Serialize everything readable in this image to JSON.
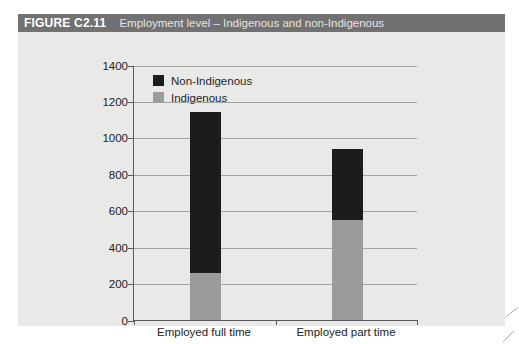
{
  "figure": {
    "label": "FIGURE C2.11",
    "title": "Employment level – Indigenous and non-Indigenous"
  },
  "colors": {
    "header_bg": "#717171",
    "figure_bg": "#e9e9e8",
    "non_indigenous": "#1c1c1c",
    "indigenous": "#9b9b9a",
    "gridline": "#a3a3a2",
    "axis": "#5a5a5a",
    "text": "#222222"
  },
  "chart_data": {
    "type": "bar",
    "stacked": true,
    "title": "Employment level – Indigenous and non-Indigenous",
    "categories": [
      "Employed full time",
      "Employed part time"
    ],
    "series": [
      {
        "name": "Indigenous",
        "color_key": "indigenous",
        "values": [
          260,
          550
        ]
      },
      {
        "name": "Non-Indigenous",
        "color_key": "non_indigenous",
        "values": [
          880,
          390
        ]
      }
    ],
    "totals": [
      1140,
      940
    ],
    "xlabel": "",
    "ylabel": "",
    "ylim": [
      0,
      1400
    ],
    "ytick_step": 200,
    "yticks": [
      0,
      200,
      400,
      600,
      800,
      1000,
      1200,
      1400
    ],
    "grid": "horizontal",
    "legend": [
      "Non-Indigenous",
      "Indigenous"
    ],
    "legend_position": "top-left-inside"
  }
}
